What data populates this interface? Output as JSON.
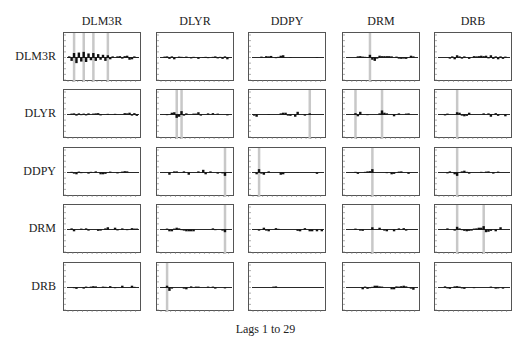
{
  "chart_data": {
    "type": "bar",
    "title": "",
    "xlabel": "Lags 1 to 29",
    "ylabel": "",
    "lags": 29,
    "ylim": [
      -1,
      1
    ],
    "grid": false,
    "legend": "none",
    "variables": [
      "DLM3R",
      "DLYR",
      "DDPY",
      "DRM",
      "DRB"
    ],
    "significance_band_color": "#c8c8c8",
    "bar_color": "#111111",
    "panels": [
      {
        "row": "DLM3R",
        "col": "DLM3R",
        "bands": [
          3,
          7,
          11,
          17
        ],
        "values": [
          0.05,
          -0.15,
          0.2,
          -0.25,
          0.22,
          -0.18,
          0.25,
          -0.2,
          0.18,
          -0.12,
          0.2,
          -0.15,
          0.15,
          -0.1,
          0.12,
          -0.15,
          0.1,
          -0.08,
          0.05,
          0.0,
          0.05,
          0.06,
          -0.05,
          0.06,
          0.08,
          -0.1,
          -0.08,
          0.05,
          0.02
        ]
      },
      {
        "row": "DLM3R",
        "col": "DLYR",
        "bands": [],
        "values": [
          0.0,
          0.04,
          0.05,
          -0.06,
          0.05,
          -0.08,
          0.0,
          0.04,
          0.03,
          0.02,
          0.04,
          0.0,
          -0.04,
          0.03,
          0.0,
          -0.06,
          0.0,
          0.02,
          0.03,
          -0.03,
          0.0,
          0.03,
          0.05,
          -0.04,
          0.03,
          -0.06,
          0.05,
          -0.08,
          0.0
        ]
      },
      {
        "row": "DLM3R",
        "col": "DDPY",
        "bands": [],
        "values": [
          0.0,
          0.0,
          0.0,
          0.04,
          0.0,
          0.06,
          0.05,
          0.07,
          0.0,
          -0.03,
          0.03,
          0.08,
          0.1,
          0.0,
          0.0,
          0.02,
          0.0,
          0.0,
          0.0,
          0.0,
          0.0,
          0.0,
          0.0,
          0.0,
          0.0,
          0.0,
          -0.02,
          0.0,
          0.0
        ]
      },
      {
        "row": "DLM3R",
        "col": "DRM",
        "bands": [
          10
        ],
        "values": [
          0.0,
          0.0,
          0.0,
          0.0,
          0.05,
          0.06,
          0.04,
          0.03,
          -0.02,
          0.12,
          -0.1,
          -0.15,
          -0.05,
          0.08,
          0.06,
          0.06,
          0.06,
          0.06,
          0.05,
          0.0,
          0.04,
          -0.05,
          -0.06,
          -0.05,
          -0.06,
          0.0,
          0.08,
          0.05,
          0.0
        ]
      },
      {
        "row": "DLM3R",
        "col": "DRB",
        "bands": [],
        "values": [
          0.0,
          0.0,
          0.0,
          0.0,
          -0.05,
          0.05,
          -0.08,
          0.1,
          0.05,
          -0.05,
          0.05,
          0.0,
          -0.06,
          0.0,
          0.06,
          0.05,
          0.06,
          0.08,
          0.06,
          0.08,
          -0.04,
          0.1,
          -0.06,
          0.05,
          -0.08,
          0.05,
          -0.06,
          0.04,
          0.0
        ]
      },
      {
        "row": "DLYR",
        "col": "DLM3R",
        "bands": [],
        "values": [
          0.0,
          0.04,
          0.05,
          -0.05,
          0.05,
          -0.03,
          0.04,
          -0.04,
          0.05,
          0.0,
          0.04,
          0.05,
          0.06,
          -0.04,
          0.0,
          0.0,
          0.03,
          0.0,
          0.0,
          0.03,
          0.0,
          0.0,
          0.0,
          0.06,
          0.05,
          0.08,
          -0.05,
          0.06,
          -0.06
        ]
      },
      {
        "row": "DLYR",
        "col": "DLYR",
        "bands": [
          7,
          9
        ],
        "values": [
          0.0,
          0.0,
          -0.03,
          0.0,
          0.08,
          0.1,
          -0.15,
          -0.1,
          0.15,
          -0.05,
          0.05,
          0.0,
          0.0,
          0.04,
          0.04,
          0.1,
          -0.05,
          0.0,
          0.0,
          0.05,
          0.0,
          0.06,
          0.0,
          0.04,
          0.0,
          0.0,
          0.0,
          -0.04,
          0.0
        ]
      },
      {
        "row": "DLYR",
        "col": "DDPY",
        "bands": [
          24
        ],
        "values": [
          -0.05,
          -0.1,
          0.0,
          0.0,
          0.0,
          0.0,
          -0.02,
          0.0,
          0.0,
          0.0,
          0.0,
          0.05,
          0.08,
          0.08,
          -0.05,
          -0.06,
          0.0,
          -0.1,
          0.12,
          0.0,
          0.0,
          -0.05,
          0.0,
          0.05,
          0.0,
          0.0,
          0.0,
          0.0,
          0.0
        ]
      },
      {
        "row": "DLYR",
        "col": "DRM",
        "bands": [
          4,
          15
        ],
        "values": [
          0.0,
          0.0,
          0.0,
          0.06,
          -0.08,
          0.12,
          0.0,
          0.0,
          -0.03,
          0.0,
          0.0,
          0.0,
          0.0,
          0.05,
          0.18,
          0.08,
          0.05,
          0.0,
          0.0,
          -0.08,
          0.0,
          0.05,
          0.0,
          0.0,
          0.04,
          0.05,
          0.0,
          0.0,
          0.0
        ]
      },
      {
        "row": "DLYR",
        "col": "DRB",
        "bands": [
          8
        ],
        "values": [
          0.0,
          0.0,
          -0.04,
          0.04,
          0.0,
          0.0,
          0.0,
          0.1,
          0.08,
          -0.05,
          -0.08,
          -0.06,
          0.08,
          0.0,
          0.0,
          0.0,
          0.0,
          0.0,
          0.05,
          0.0,
          0.05,
          -0.1,
          0.0,
          0.06,
          -0.06,
          0.0,
          0.0,
          -0.08,
          0.0
        ]
      },
      {
        "row": "DDPY",
        "col": "DLM3R",
        "bands": [],
        "values": [
          0.0,
          0.03,
          -0.05,
          -0.08,
          0.04,
          -0.03,
          0.0,
          0.0,
          -0.05,
          0.03,
          0.0,
          0.05,
          0.0,
          -0.08,
          -0.08,
          -0.06,
          0.0,
          0.04,
          0.0,
          0.0,
          -0.04,
          0.0,
          0.04,
          0.06,
          0.05,
          0.0,
          0.0,
          0.0,
          0.0
        ]
      },
      {
        "row": "DDPY",
        "col": "DLYR",
        "bands": [
          27
        ],
        "values": [
          0.0,
          0.0,
          0.0,
          -0.1,
          0.0,
          0.05,
          0.05,
          0.0,
          0.0,
          0.05,
          0.0,
          -0.1,
          0.0,
          0.0,
          0.0,
          0.05,
          0.0,
          0.12,
          -0.08,
          0.0,
          0.05,
          0.0,
          0.0,
          -0.05,
          0.0,
          -0.04,
          -0.15,
          0.0,
          0.0
        ]
      },
      {
        "row": "DDPY",
        "col": "DDPY",
        "bands": [
          3
        ],
        "values": [
          0.0,
          -0.08,
          0.15,
          -0.05,
          -0.1,
          0.0,
          0.05,
          0.0,
          0.0,
          0.0,
          0.0,
          -0.1,
          -0.08,
          0.0,
          0.0,
          0.0,
          0.0,
          0.0,
          0.0,
          0.0,
          0.0,
          0.0,
          0.0,
          0.0,
          0.0,
          0.0,
          -0.06,
          0.0,
          0.0
        ]
      },
      {
        "row": "DDPY",
        "col": "DRM",
        "bands": [
          11
        ],
        "values": [
          0.0,
          0.0,
          0.0,
          0.03,
          -0.06,
          0.0,
          0.0,
          0.03,
          0.05,
          0.06,
          0.15,
          0.0,
          0.0,
          0.0,
          0.0,
          0.0,
          -0.03,
          0.0,
          -0.08,
          -0.06,
          0.0,
          0.04,
          0.05,
          0.0,
          0.0,
          -0.06,
          0.0,
          0.0,
          0.0
        ]
      },
      {
        "row": "DDPY",
        "col": "DRB",
        "bands": [
          8
        ],
        "values": [
          0.0,
          0.0,
          0.0,
          -0.04,
          0.05,
          0.0,
          -0.08,
          -0.15,
          0.0,
          0.05,
          0.08,
          0.03,
          -0.05,
          0.0,
          0.0,
          0.0,
          0.0,
          0.03,
          0.0,
          0.04,
          0.05,
          0.0,
          -0.05,
          0.0,
          0.04,
          0.0,
          0.0,
          0.0,
          0.0
        ]
      },
      {
        "row": "DRM",
        "col": "DLM3R",
        "bands": [],
        "values": [
          0.0,
          0.05,
          -0.08,
          0.0,
          0.0,
          0.04,
          0.0,
          0.05,
          -0.05,
          0.0,
          0.0,
          0.0,
          -0.06,
          -0.05,
          0.0,
          0.05,
          0.1,
          0.0,
          0.0,
          0.08,
          -0.04,
          0.0,
          0.05,
          0.0,
          -0.03,
          0.0,
          0.06,
          0.04,
          0.04
        ]
      },
      {
        "row": "DRM",
        "col": "DLYR",
        "bands": [
          27
        ],
        "values": [
          0.0,
          0.0,
          0.04,
          -0.08,
          -0.08,
          0.04,
          0.08,
          0.05,
          -0.03,
          -0.05,
          -0.08,
          -0.08,
          -0.08,
          -0.08,
          0.0,
          0.0,
          0.0,
          0.0,
          0.0,
          0.0,
          0.0,
          0.05,
          -0.03,
          0.0,
          0.0,
          -0.05,
          -0.12,
          0.0,
          0.0
        ]
      },
      {
        "row": "DRM",
        "col": "DDPY",
        "bands": [],
        "values": [
          0.0,
          0.0,
          -0.05,
          0.0,
          0.08,
          -0.05,
          -0.08,
          0.0,
          0.0,
          0.06,
          0.03,
          0.0,
          0.0,
          0.0,
          0.0,
          0.0,
          0.0,
          0.0,
          -0.06,
          -0.08,
          0.0,
          0.06,
          0.0,
          -0.08,
          -0.08,
          0.0,
          -0.08,
          0.0,
          -0.08
        ]
      },
      {
        "row": "DRM",
        "col": "DRM",
        "bands": [
          11
        ],
        "values": [
          0.0,
          0.0,
          0.0,
          0.04,
          0.0,
          -0.05,
          -0.06,
          0.0,
          0.0,
          0.0,
          0.1,
          0.0,
          0.0,
          0.08,
          0.0,
          -0.05,
          -0.08,
          0.0,
          0.0,
          -0.08,
          0.0,
          0.05,
          0.0,
          0.06,
          -0.05,
          0.0,
          0.0,
          0.0,
          0.0
        ]
      },
      {
        "row": "DRM",
        "col": "DRB",
        "bands": [
          8,
          19
        ],
        "values": [
          0.0,
          0.0,
          0.0,
          0.05,
          0.0,
          0.0,
          -0.05,
          0.12,
          0.05,
          -0.03,
          -0.06,
          -0.08,
          -0.06,
          -0.05,
          0.04,
          0.05,
          0.08,
          0.08,
          0.15,
          -0.12,
          -0.1,
          -0.06,
          0.0,
          -0.08,
          0.0,
          0.1,
          0.0,
          0.0,
          0.0
        ]
      },
      {
        "row": "DRB",
        "col": "DLM3R",
        "bands": [],
        "values": [
          0.0,
          0.0,
          -0.03,
          -0.06,
          0.0,
          0.0,
          -0.05,
          0.04,
          0.0,
          0.04,
          0.06,
          0.05,
          0.0,
          0.0,
          0.04,
          0.03,
          0.0,
          0.06,
          0.0,
          -0.03,
          0.0,
          0.0,
          0.08,
          0.0,
          0.0,
          0.0,
          0.08,
          0.03,
          0.0
        ]
      },
      {
        "row": "DRB",
        "col": "DLYR",
        "bands": [
          3
        ],
        "values": [
          0.0,
          0.0,
          0.08,
          -0.15,
          -0.05,
          0.0,
          0.0,
          0.0,
          0.0,
          -0.05,
          -0.08,
          0.0,
          0.05,
          0.0,
          0.04,
          0.04,
          0.0,
          0.0,
          0.0,
          0.04,
          0.0,
          0.04,
          -0.05,
          0.0,
          0.0,
          0.0,
          -0.04,
          0.0,
          0.0
        ]
      },
      {
        "row": "DRB",
        "col": "DDPY",
        "bands": [],
        "values": [
          0.0,
          0.0,
          0.0,
          0.0,
          0.0,
          0.0,
          0.0,
          0.0,
          0.04,
          0.05,
          0.0,
          0.0,
          0.0,
          0.0,
          0.0,
          0.0,
          0.0,
          0.0,
          0.0,
          0.0,
          0.0,
          0.0,
          0.0,
          0.0,
          0.0,
          0.0,
          0.0,
          0.0,
          0.0
        ]
      },
      {
        "row": "DRB",
        "col": "DRM",
        "bands": [],
        "values": [
          0.0,
          0.0,
          0.0,
          0.0,
          0.0,
          0.0,
          -0.08,
          0.04,
          -0.06,
          -0.03,
          0.03,
          0.08,
          0.08,
          0.05,
          0.04,
          0.0,
          0.0,
          0.0,
          -0.08,
          -0.08,
          0.05,
          0.04,
          0.06,
          0.08,
          0.05,
          0.0,
          -0.05,
          -0.1,
          0.0
        ]
      },
      {
        "row": "DRB",
        "col": "DRB",
        "bands": [],
        "values": [
          0.0,
          0.0,
          0.05,
          -0.04,
          -0.06,
          0.0,
          0.05,
          0.06,
          0.04,
          -0.04,
          -0.06,
          0.0,
          0.0,
          0.0,
          -0.03,
          0.0,
          0.0,
          0.0,
          0.0,
          0.0,
          0.0,
          0.04,
          0.0,
          -0.05,
          -0.04,
          0.0,
          -0.05,
          0.0,
          0.0
        ]
      }
    ]
  },
  "layout": {
    "col_x": [
      63,
      156,
      248,
      342,
      434
    ],
    "row_y": [
      32,
      89,
      147,
      204,
      262
    ],
    "panel_w": 78,
    "panel_h": 49
  },
  "labels": {
    "columns": [
      "DLM3R",
      "DLYR",
      "DDPY",
      "DRM",
      "DRB"
    ],
    "rows": [
      "DLM3R",
      "DLYR",
      "DDPY",
      "DRM",
      "DRB"
    ],
    "xlabel": "Lags 1 to 29"
  }
}
